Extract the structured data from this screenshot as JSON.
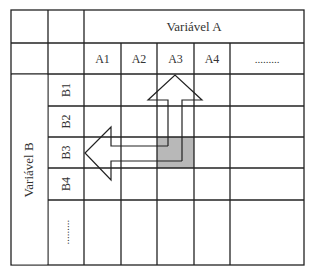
{
  "diagram": {
    "variable_a": {
      "title": "Variável A",
      "columns": [
        "A1",
        "A2",
        "A3",
        "A4",
        "........."
      ]
    },
    "variable_b": {
      "title": "Variável B",
      "rows": [
        "B1",
        "B2",
        "B3",
        "B4",
        "........."
      ]
    },
    "highlighted_cell": {
      "column": "A3",
      "row": "B3",
      "color": "#b8b8b8"
    },
    "arrows": [
      {
        "name": "up-arrow",
        "from": "A3/B3",
        "to": "A3 header"
      },
      {
        "name": "left-arrow",
        "from": "A3/B3",
        "to": "B3 header"
      }
    ],
    "line_color": "#222222"
  }
}
